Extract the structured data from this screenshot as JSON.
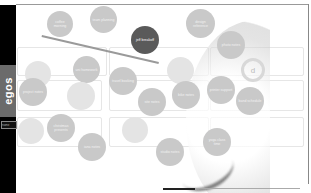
{
  "app": {
    "brand": "egos",
    "name_field": "name"
  },
  "bubbles": [
    {
      "id": "b1",
      "label": "coffee morning",
      "x": 47,
      "y": 11,
      "d": 26,
      "style": "normal"
    },
    {
      "id": "b2",
      "label": "team planning",
      "x": 90,
      "y": 6,
      "d": 27,
      "style": "normal"
    },
    {
      "id": "b3",
      "label": "jeff breakoff",
      "x": 131,
      "y": 26,
      "d": 28,
      "style": "dark"
    },
    {
      "id": "b4",
      "label": "design reference",
      "x": 186,
      "y": 9,
      "d": 29,
      "style": "normal"
    },
    {
      "id": "b5",
      "label": "photo notes",
      "x": 217,
      "y": 31,
      "d": 28,
      "style": "normal"
    },
    {
      "id": "b6",
      "label": "",
      "x": 25,
      "y": 61,
      "d": 26,
      "style": "faint"
    },
    {
      "id": "b7",
      "label": "uni homework",
      "x": 73,
      "y": 56,
      "d": 27,
      "style": "normal"
    },
    {
      "id": "b8",
      "label": "travel booking",
      "x": 109,
      "y": 67,
      "d": 28,
      "style": "normal"
    },
    {
      "id": "b9",
      "label": "",
      "x": 167,
      "y": 57,
      "d": 27,
      "style": "faint"
    },
    {
      "id": "b10",
      "label": "project notes",
      "x": 19,
      "y": 78,
      "d": 28,
      "style": "normal"
    },
    {
      "id": "b11",
      "label": "",
      "x": 67,
      "y": 82,
      "d": 28,
      "style": "faint"
    },
    {
      "id": "b12",
      "label": "site notes",
      "x": 138,
      "y": 88,
      "d": 28,
      "style": "normal"
    },
    {
      "id": "b13",
      "label": "bike notes",
      "x": 172,
      "y": 81,
      "d": 28,
      "style": "normal"
    },
    {
      "id": "b14",
      "label": "printer support",
      "x": 207,
      "y": 76,
      "d": 28,
      "style": "normal"
    },
    {
      "id": "b15",
      "label": "band schedule",
      "x": 236,
      "y": 87,
      "d": 28,
      "style": "normal"
    },
    {
      "id": "b16",
      "label": "",
      "x": 18,
      "y": 118,
      "d": 26,
      "style": "faint"
    },
    {
      "id": "b17",
      "label": "christmas presents",
      "x": 47,
      "y": 114,
      "d": 28,
      "style": "normal"
    },
    {
      "id": "b18",
      "label": "",
      "x": 122,
      "y": 117,
      "d": 26,
      "style": "faint"
    },
    {
      "id": "b19",
      "label": "iana notes",
      "x": 78,
      "y": 133,
      "d": 28,
      "style": "normal"
    },
    {
      "id": "b20",
      "label": "studio notes",
      "x": 156,
      "y": 138,
      "d": 28,
      "style": "normal"
    },
    {
      "id": "b21",
      "label": "yoga class time",
      "x": 203,
      "y": 128,
      "d": 28,
      "style": "normal"
    }
  ],
  "dial": {
    "icon": "d"
  },
  "colors": {
    "sidebar": "#000000",
    "brand_bg": "#6b6b6b",
    "bubble": "#c9c9c9",
    "bubble_active": "#5a5a5a"
  }
}
